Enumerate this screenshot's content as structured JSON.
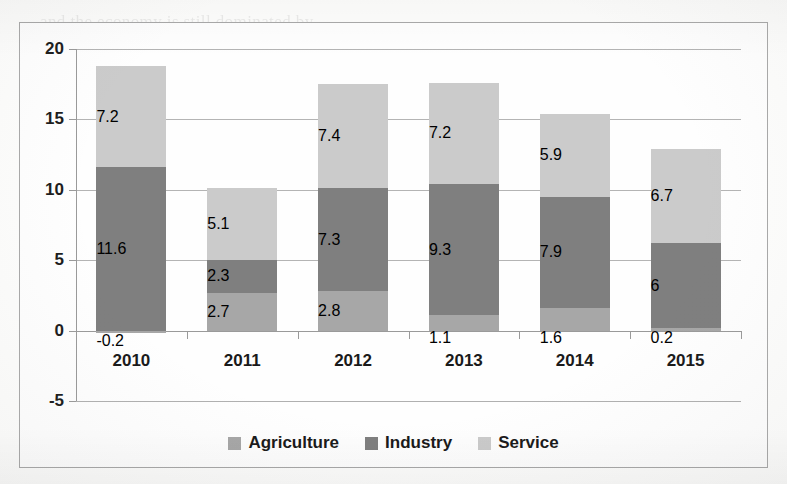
{
  "chart_data": {
    "type": "bar",
    "stacked": true,
    "title": "",
    "subtitle": "",
    "xlabel": "",
    "ylabel": "",
    "categories": [
      "2010",
      "2011",
      "2012",
      "2013",
      "2014",
      "2015"
    ],
    "series": [
      {
        "name": "Agriculture",
        "color": "#a7a7a7",
        "values": [
          -0.2,
          2.7,
          2.8,
          1.1,
          1.6,
          0.2
        ],
        "labels": [
          "-0.2",
          "2.7",
          "2.8",
          "1.1",
          "1.6",
          "0.2"
        ]
      },
      {
        "name": "Industry",
        "color": "#7f7f7f",
        "values": [
          11.6,
          2.3,
          7.3,
          9.3,
          7.9,
          6
        ],
        "labels": [
          "11.6",
          "2.3",
          "7.3",
          "9.3",
          "7.9",
          "6"
        ]
      },
      {
        "name": "Service",
        "color": "#cbcbcb",
        "values": [
          7.2,
          5.1,
          7.4,
          7.2,
          5.9,
          6.7
        ],
        "labels": [
          "7.2",
          "5.1",
          "7.4",
          "7.2",
          "5.9",
          "6.7"
        ]
      }
    ],
    "totals": [
      18.6,
      10.1,
      17.5,
      17.6,
      15.4,
      12.9
    ],
    "yticks": [
      "20",
      "15",
      "10",
      "5",
      "0",
      "-5"
    ],
    "ytick_values": [
      20,
      15,
      10,
      5,
      0,
      -5
    ],
    "ylim": [
      -5,
      20
    ],
    "grid": true,
    "legend_position": "bottom",
    "legend": [
      "Agriculture",
      "Industry",
      "Service"
    ]
  },
  "legend": {
    "items": [
      {
        "label": "Agriculture",
        "color": "#a7a7a7"
      },
      {
        "label": "Industry",
        "color": "#7f7f7f"
      },
      {
        "label": "Service",
        "color": "#cbcbcb"
      }
    ]
  },
  "colors": {
    "agriculture": "#a7a7a7",
    "industry": "#7f7f7f",
    "service": "#cbcbcb",
    "grid": "#b4b4b4",
    "axis": "#9a9a9a",
    "frame": "#a9a9a9",
    "text": "#1a1a1a",
    "background": "#fefefe"
  },
  "ghost_text": [
    {
      "t": "and the economy is still dominated by",
      "x": 40,
      "y": 12
    },
    {
      "t": "the agricultural sector in terms of",
      "x": 60,
      "y": 128
    },
    {
      "t": "employment and contribution to the",
      "x": 44,
      "y": 160
    },
    {
      "t": "national output of the country",
      "x": 52,
      "y": 236
    },
    {
      "t": "growth rate has been fluctuating over",
      "x": 36,
      "y": 268
    },
    {
      "t": "the period the growth of GDP",
      "x": 70,
      "y": 372
    },
    {
      "t": "sector has been improving gradually",
      "x": 46,
      "y": 404
    },
    {
      "t": "industry and service sector",
      "x": 120,
      "y": 440
    }
  ]
}
